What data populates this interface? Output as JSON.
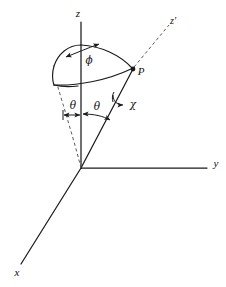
{
  "figure": {
    "background_color": "#ffffff",
    "ink_color": "#1b1b1b",
    "dashed_color": "#5c5c5c"
  },
  "labels": {
    "axis_z": "z",
    "axis_z_prime": "z'",
    "axis_y": "y",
    "axis_x": "x",
    "point_p": "P",
    "angle_phi": "ϕ",
    "angle_theta_left": "θ",
    "angle_theta_right": "θ",
    "angle_chi": "χ"
  },
  "geometry": {
    "origin": {
      "x": 81,
      "y": 168
    },
    "point_p": {
      "x": 133,
      "y": 69
    },
    "z_axis_top": {
      "x": 81,
      "y": 22
    },
    "z_prime_tip": {
      "x": 172,
      "y": 22
    },
    "y_axis_tip": {
      "x": 208,
      "y": 168
    },
    "x_axis_tip": {
      "x": 21,
      "y": 264
    },
    "cone_apex_on_z": {
      "x": 81,
      "y": 45
    },
    "dashed_cone_edge_tip": {
      "x": 57,
      "y": 84
    }
  }
}
